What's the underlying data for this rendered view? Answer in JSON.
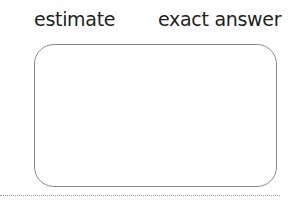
{
  "labels": {
    "estimate": "estimate",
    "exact_answer": "exact answer"
  },
  "colors": {
    "text": "#231f20",
    "box_border": "#8a8a8a"
  }
}
